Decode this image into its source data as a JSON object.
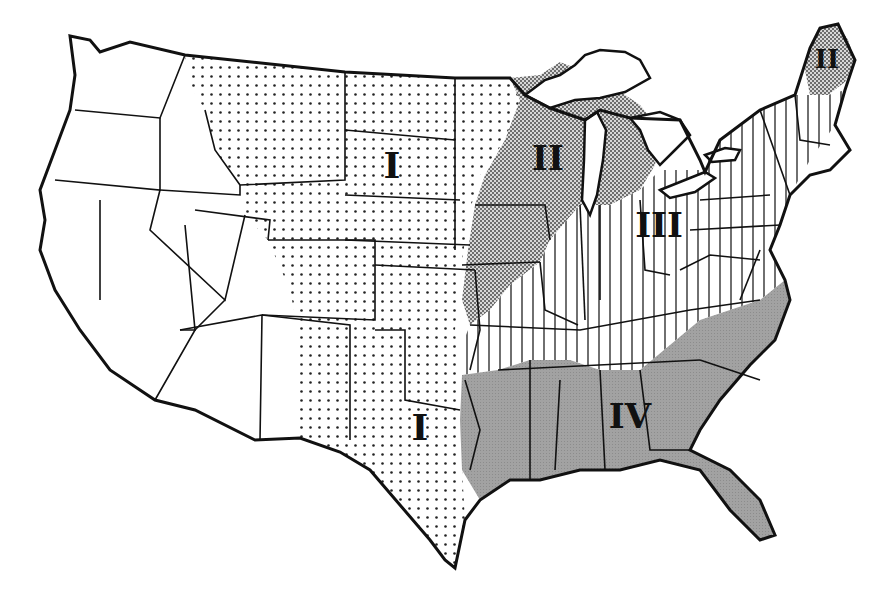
{
  "map": {
    "subject": "Contiguous United States regional map",
    "regions": [
      {
        "id": "I",
        "label": "I",
        "pattern": "dots",
        "description": "Great Plains region (Montana east to Dakotas, Nebraska, Kansas, Oklahoma, Texas)"
      },
      {
        "id": "II",
        "label": "II",
        "pattern": "checkered",
        "description": "Upper Midwest (Minnesota, Wisconsin, Michigan, Iowa) and northern Maine"
      },
      {
        "id": "III",
        "label": "III",
        "pattern": "vertical-stripes",
        "description": "Central & Northeast (Illinois, Indiana, Ohio, Kentucky, Tennessee, Pennsylvania, New York, New England)"
      },
      {
        "id": "IV",
        "label": "IV",
        "pattern": "gray-fill",
        "description": "Southeast (Louisiana, Mississippi, Alabama, Georgia, Florida, Carolinas)"
      }
    ],
    "labels": [
      {
        "text": "I",
        "x": 392,
        "y": 178
      },
      {
        "text": "II",
        "x": 548,
        "y": 170
      },
      {
        "text": "III",
        "x": 659,
        "y": 237
      },
      {
        "text": "IV",
        "x": 630,
        "y": 428
      },
      {
        "text": "I",
        "x": 420,
        "y": 440
      },
      {
        "text": "II",
        "x": 827,
        "y": 68
      }
    ],
    "colors": {
      "background": "#ffffff",
      "outline": "#111111",
      "gray_fill": "#9a9a9a",
      "checker_dark": "#6e6e6e",
      "dot": "#222222"
    }
  }
}
